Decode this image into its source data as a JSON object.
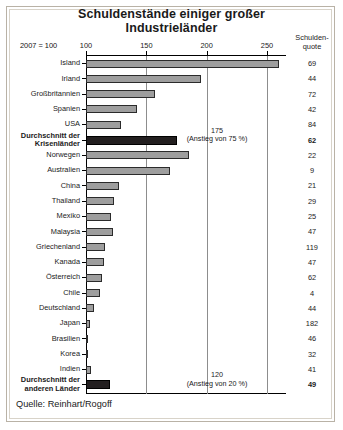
{
  "title": {
    "line1": "Schuldenstände einiger großer",
    "line2": "Industrieländer"
  },
  "base_note": "2007 = 100",
  "column_header": {
    "line1": "Schulden-",
    "line2": "quote"
  },
  "source": "Quelle: Reinhart/Rogoff",
  "annotations": [
    {
      "value": "175",
      "detail": "(Anstieg von 75 %)"
    },
    {
      "value": "120",
      "detail": "(Anstieg von 20 %)"
    }
  ],
  "chart_data": {
    "type": "bar",
    "orientation": "horizontal",
    "title": "Schuldenstände einiger großer Industrieländer",
    "xlabel": "2007 = 100",
    "ylabel": "",
    "xlim": [
      100,
      270
    ],
    "ticks": [
      100,
      150,
      200,
      250
    ],
    "grid": true,
    "legend": false,
    "source": "Quelle: Reinhart/Rogoff",
    "value_column_header": "Schuldenquote",
    "categories": [
      "Island",
      "Irland",
      "Großbritannien",
      "Spanien",
      "USA",
      "Durchschnitt der Krisenländer",
      "Norwegen",
      "Australien",
      "China",
      "Thailand",
      "Mexiko",
      "Malaysia",
      "Griechenland",
      "Kanada",
      "Österreich",
      "Chile",
      "Deutschland",
      "Japan",
      "Brasilien",
      "Korea",
      "Indien",
      "Durchschnitt der anderen Länder"
    ],
    "series": [
      {
        "name": "Schuldenstand (2007 = 100)",
        "values": [
          260,
          195,
          157,
          142,
          129,
          175,
          185,
          170,
          127,
          123,
          121,
          122,
          116,
          115,
          113,
          112,
          107,
          103,
          102,
          102,
          104,
          120
        ]
      },
      {
        "name": "Schuldenquote",
        "values": [
          69,
          44,
          72,
          42,
          84,
          62,
          22,
          9,
          21,
          29,
          25,
          47,
          119,
          47,
          62,
          4,
          44,
          182,
          46,
          32,
          41,
          49
        ]
      }
    ],
    "highlighted": [
      "Durchschnitt der Krisenländer",
      "Durchschnitt der anderen Länder"
    ]
  },
  "rows": [
    {
      "label": "Island",
      "label2": "",
      "bar": 260,
      "quote": "69",
      "avg": false
    },
    {
      "label": "Irland",
      "label2": "",
      "bar": 195,
      "quote": "44",
      "avg": false
    },
    {
      "label": "Großbritannien",
      "label2": "",
      "bar": 157,
      "quote": "72",
      "avg": false
    },
    {
      "label": "Spanien",
      "label2": "",
      "bar": 142,
      "quote": "42",
      "avg": false
    },
    {
      "label": "USA",
      "label2": "",
      "bar": 129,
      "quote": "84",
      "avg": false
    },
    {
      "label": "Durchschnitt der",
      "label2": "Krisenländer",
      "bar": 175,
      "quote": "62",
      "avg": true
    },
    {
      "label": "Norwegen",
      "label2": "",
      "bar": 185,
      "quote": "22",
      "avg": false
    },
    {
      "label": "Australien",
      "label2": "",
      "bar": 170,
      "quote": "9",
      "avg": false
    },
    {
      "label": "China",
      "label2": "",
      "bar": 127,
      "quote": "21",
      "avg": false
    },
    {
      "label": "Thailand",
      "label2": "",
      "bar": 123,
      "quote": "29",
      "avg": false
    },
    {
      "label": "Mexiko",
      "label2": "",
      "bar": 121,
      "quote": "25",
      "avg": false
    },
    {
      "label": "Malaysia",
      "label2": "",
      "bar": 122,
      "quote": "47",
      "avg": false
    },
    {
      "label": "Griechenland",
      "label2": "",
      "bar": 116,
      "quote": "119",
      "avg": false
    },
    {
      "label": "Kanada",
      "label2": "",
      "bar": 115,
      "quote": "47",
      "avg": false
    },
    {
      "label": "Österreich",
      "label2": "",
      "bar": 113,
      "quote": "62",
      "avg": false
    },
    {
      "label": "Chile",
      "label2": "",
      "bar": 112,
      "quote": "4",
      "avg": false
    },
    {
      "label": "Deutschland",
      "label2": "",
      "bar": 107,
      "quote": "44",
      "avg": false
    },
    {
      "label": "Japan",
      "label2": "",
      "bar": 103,
      "quote": "182",
      "avg": false
    },
    {
      "label": "Brasilien",
      "label2": "",
      "bar": 102,
      "quote": "46",
      "avg": false
    },
    {
      "label": "Korea",
      "label2": "",
      "bar": 102,
      "quote": "32",
      "avg": false
    },
    {
      "label": "Indien",
      "label2": "",
      "bar": 104,
      "quote": "41",
      "avg": false
    },
    {
      "label": "Durchschnitt der",
      "label2": "anderen Länder",
      "bar": 120,
      "quote": "49",
      "avg": true
    }
  ]
}
